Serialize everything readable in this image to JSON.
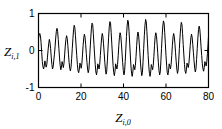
{
  "chart_data": {
    "type": "line",
    "title": "",
    "xlabel": "Z",
    "xlabel_sub": "i,0",
    "ylabel": "Z",
    "ylabel_sub": "i,1",
    "xlim": [
      0,
      80
    ],
    "ylim": [
      -1,
      1
    ],
    "xticks": [
      0,
      20,
      40,
      60,
      80
    ],
    "xtick_labels": [
      "0",
      "20",
      "40",
      "60",
      "80"
    ],
    "yticks": [
      -1,
      0,
      1
    ],
    "ytick_labels": [
      "-1",
      "0",
      "1"
    ],
    "grid": false,
    "legend": null,
    "line_color": "#000000",
    "frame_color": "#000000",
    "series": [
      {
        "name": "trajectory",
        "description": "Chaotic oscillatory time series with sharp tall peaks and smaller intermediate bumps, period approximately 5.7",
        "x": [
          0.0,
          0.3,
          0.6,
          0.9,
          1.2,
          1.5,
          1.8,
          2.1,
          2.4,
          2.7,
          3.0,
          3.3,
          3.6,
          3.9,
          4.2,
          4.5,
          4.8,
          5.1,
          5.4,
          5.7,
          6.0,
          6.3,
          6.6,
          6.9,
          7.2,
          7.5,
          7.8,
          8.1,
          8.4,
          8.7,
          9.0,
          9.3,
          9.6,
          9.9,
          10.2,
          10.5,
          10.8,
          11.1,
          11.4,
          11.7,
          12.0,
          12.3,
          12.6,
          12.9,
          13.2,
          13.5,
          13.8,
          14.1,
          14.4,
          14.7,
          15.0,
          15.3,
          15.6,
          15.9,
          16.2,
          16.5,
          16.8,
          17.1,
          17.4,
          17.7,
          18.0,
          18.3,
          18.6,
          18.9,
          19.2,
          19.5,
          19.8,
          20.1,
          20.4,
          20.7,
          21.0,
          21.3,
          21.6,
          21.9,
          22.2,
          22.5,
          22.8,
          23.1,
          23.4,
          23.7,
          24.0,
          24.3,
          24.6,
          24.9,
          25.2,
          25.5,
          25.8,
          26.1,
          26.4,
          26.7,
          27.0,
          27.3,
          27.6,
          27.9,
          28.2,
          28.5,
          28.8,
          29.1,
          29.4,
          29.7,
          30.0,
          30.3,
          30.6,
          30.9,
          31.2,
          31.5,
          31.8,
          32.1,
          32.4,
          32.7,
          33.0,
          33.3,
          33.6,
          33.9,
          34.2,
          34.5,
          34.8,
          35.1,
          35.4,
          35.7,
          36.0,
          36.3,
          36.6,
          36.9,
          37.2,
          37.5,
          37.8,
          38.1,
          38.4,
          38.7,
          39.0,
          39.3,
          39.6,
          39.9,
          40.2,
          40.5,
          40.8,
          41.1,
          41.4,
          41.7,
          42.0,
          42.3,
          42.6,
          42.9,
          43.2,
          43.5,
          43.8,
          44.1,
          44.4,
          44.7,
          45.0,
          45.3,
          45.6,
          45.9,
          46.2,
          46.5,
          46.8,
          47.1,
          47.4,
          47.7,
          48.0,
          48.3,
          48.6,
          48.9,
          49.2,
          49.5,
          49.8,
          50.1,
          50.4,
          50.7,
          51.0,
          51.3,
          51.6,
          51.9,
          52.2,
          52.5,
          52.8,
          53.1,
          53.4,
          53.7,
          54.0,
          54.3,
          54.6,
          54.9,
          55.2,
          55.5,
          55.8,
          56.1,
          56.4,
          56.7,
          57.0,
          57.3,
          57.6,
          57.9,
          58.2,
          58.5,
          58.8,
          59.1,
          59.4,
          59.7,
          60.0,
          60.3,
          60.6,
          60.9,
          61.2,
          61.5,
          61.8,
          62.1,
          62.4,
          62.7,
          63.0,
          63.3,
          63.6,
          63.9,
          64.2,
          64.5,
          64.8,
          65.1,
          65.4,
          65.7,
          66.0,
          66.3,
          66.6,
          66.9,
          67.2,
          67.5,
          67.8,
          68.1,
          68.4,
          68.7,
          69.0,
          69.3,
          69.6,
          69.9,
          70.2,
          70.5,
          70.8,
          71.1,
          71.4,
          71.7,
          72.0,
          72.3,
          72.6,
          72.9,
          73.2,
          73.5,
          73.8,
          74.1,
          74.4,
          74.7,
          75.0,
          75.3,
          75.6,
          75.9,
          76.2,
          76.5,
          76.8,
          77.1,
          77.4,
          77.7,
          78.0,
          78.3,
          78.6,
          78.9,
          79.2,
          79.5,
          79.8,
          80.0
        ],
        "y": [
          0.33,
          0.42,
          0.46,
          0.4,
          0.22,
          -0.05,
          -0.3,
          -0.44,
          -0.5,
          -0.42,
          -0.28,
          -0.35,
          -0.45,
          -0.38,
          -0.2,
          0.0,
          0.18,
          0.3,
          0.22,
          0.05,
          -0.18,
          -0.38,
          -0.5,
          -0.44,
          -0.26,
          -0.1,
          0.1,
          0.34,
          0.52,
          0.6,
          0.52,
          0.3,
          0.05,
          -0.2,
          -0.4,
          -0.52,
          -0.45,
          -0.3,
          -0.38,
          -0.46,
          -0.34,
          -0.12,
          0.12,
          0.3,
          0.4,
          0.33,
          0.14,
          -0.1,
          -0.32,
          -0.48,
          -0.55,
          -0.46,
          -0.22,
          0.06,
          0.32,
          0.56,
          0.68,
          0.62,
          0.4,
          0.12,
          -0.14,
          -0.38,
          -0.55,
          -0.6,
          -0.5,
          -0.34,
          -0.4,
          -0.48,
          -0.36,
          -0.12,
          0.14,
          0.34,
          0.44,
          0.36,
          0.16,
          -0.08,
          -0.32,
          -0.5,
          -0.6,
          -0.52,
          -0.26,
          0.04,
          0.34,
          0.6,
          0.74,
          0.7,
          0.46,
          0.16,
          -0.12,
          -0.38,
          -0.58,
          -0.66,
          -0.55,
          -0.36,
          -0.42,
          -0.5,
          -0.38,
          -0.14,
          0.12,
          0.34,
          0.46,
          0.38,
          0.18,
          -0.06,
          -0.32,
          -0.52,
          -0.64,
          -0.56,
          -0.28,
          0.04,
          0.36,
          0.64,
          0.78,
          0.74,
          0.48,
          0.18,
          -0.12,
          -0.4,
          -0.6,
          -0.68,
          -0.56,
          -0.36,
          -0.42,
          -0.5,
          -0.38,
          -0.14,
          0.14,
          0.36,
          0.48,
          0.4,
          0.2,
          -0.06,
          -0.32,
          -0.54,
          -0.66,
          -0.58,
          -0.3,
          0.04,
          0.38,
          0.66,
          0.82,
          0.78,
          0.52,
          0.2,
          -0.12,
          -0.42,
          -0.62,
          -0.7,
          -0.58,
          -0.38,
          -0.44,
          -0.52,
          -0.4,
          -0.16,
          0.14,
          0.38,
          0.5,
          0.42,
          0.2,
          -0.06,
          -0.34,
          -0.54,
          -0.68,
          -0.6,
          -0.3,
          0.06,
          0.4,
          0.68,
          0.84,
          0.78,
          0.52,
          0.2,
          -0.14,
          -0.42,
          -0.62,
          -0.7,
          -0.58,
          -0.38,
          -0.44,
          -0.52,
          -0.4,
          -0.16,
          0.14,
          0.38,
          0.48,
          0.4,
          0.2,
          -0.06,
          -0.32,
          -0.54,
          -0.66,
          -0.58,
          -0.28,
          0.06,
          0.4,
          0.66,
          0.8,
          0.74,
          0.48,
          0.18,
          -0.14,
          -0.4,
          -0.6,
          -0.66,
          -0.55,
          -0.36,
          -0.42,
          -0.5,
          -0.38,
          -0.14,
          0.14,
          0.36,
          0.46,
          0.38,
          0.18,
          -0.06,
          -0.3,
          -0.5,
          -0.62,
          -0.54,
          -0.26,
          0.06,
          0.36,
          0.62,
          0.76,
          0.7,
          0.46,
          0.16,
          -0.12,
          -0.38,
          -0.56,
          -0.62,
          -0.52,
          -0.34,
          -0.4,
          -0.46,
          -0.34,
          -0.12,
          0.14,
          0.34,
          0.44,
          0.36,
          0.16,
          -0.06,
          -0.28,
          -0.48,
          -0.58,
          -0.5,
          -0.24,
          0.06,
          0.34,
          0.56,
          0.66,
          0.58,
          0.36,
          0.1,
          -0.14,
          -0.36,
          -0.5,
          -0.56,
          -0.46,
          -0.3,
          -0.36,
          -0.42,
          -0.3,
          -0.08,
          0.18,
          0.38
        ]
      }
    ]
  }
}
